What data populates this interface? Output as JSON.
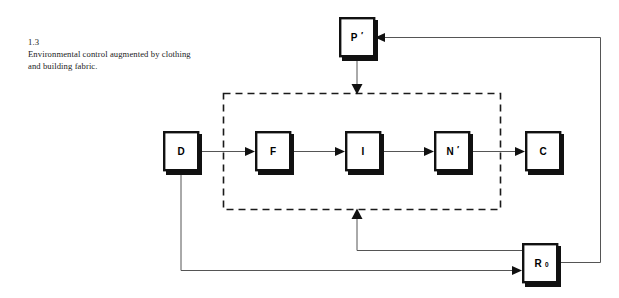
{
  "figure": {
    "number": "1.3",
    "caption": "Environmental control augmented by clothing and building fabric."
  },
  "diagram": {
    "type": "block-flow-diagram",
    "background_color": "#ffffff",
    "box_fill": "#ffffff",
    "box_border_color": "#111111",
    "line_color": "#555555",
    "dashed_boundary_color": "#1a1a1a",
    "nodes": [
      {
        "id": "D",
        "label": "D",
        "prime": "",
        "subscript": "",
        "x": 163,
        "y": 131,
        "w": 36,
        "h": 41
      },
      {
        "id": "F",
        "label": "F",
        "prime": "",
        "subscript": "",
        "x": 255,
        "y": 131,
        "w": 36,
        "h": 41
      },
      {
        "id": "I",
        "label": "I",
        "prime": "",
        "subscript": "",
        "x": 345,
        "y": 131,
        "w": 36,
        "h": 41
      },
      {
        "id": "N",
        "label": "N",
        "prime": "′",
        "subscript": "",
        "x": 434,
        "y": 131,
        "w": 36,
        "h": 41
      },
      {
        "id": "C",
        "label": "C",
        "prime": "",
        "subscript": "",
        "x": 525,
        "y": 131,
        "w": 36,
        "h": 41
      },
      {
        "id": "P",
        "label": "P",
        "prime": "′",
        "subscript": "",
        "x": 339,
        "y": 17,
        "w": 36,
        "h": 41
      },
      {
        "id": "R0",
        "label": "R",
        "prime": "",
        "subscript": "0",
        "x": 522,
        "y": 243,
        "w": 36,
        "h": 41
      }
    ],
    "group_boundary": {
      "label": "",
      "x": 223,
      "y": 93,
      "w": 277,
      "h": 116,
      "style": "dashed",
      "encloses": [
        "F",
        "I",
        "N"
      ]
    },
    "connections": [
      {
        "from": "D",
        "to": "F",
        "arrow": true,
        "route": "horizontal"
      },
      {
        "from": "F",
        "to": "I",
        "arrow": true,
        "route": "horizontal"
      },
      {
        "from": "I",
        "to": "N",
        "arrow": true,
        "route": "horizontal"
      },
      {
        "from": "N",
        "to": "C",
        "arrow": true,
        "route": "horizontal"
      },
      {
        "from": "P",
        "to": "group_boundary_top",
        "arrow": true,
        "route": "vertical-down"
      },
      {
        "from": "R0",
        "to": "group_boundary_bottom",
        "arrow": true,
        "route": "left-then-up"
      },
      {
        "from": "D",
        "to": "R0",
        "arrow": true,
        "route": "down-then-right"
      },
      {
        "from": "R0",
        "to": "P",
        "arrow": true,
        "route": "right-up-then-left"
      }
    ]
  }
}
